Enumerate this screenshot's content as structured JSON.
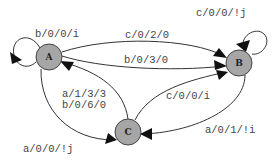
{
  "diagram": {
    "type": "state-machine",
    "nodes": [
      {
        "id": "A",
        "label": "A"
      },
      {
        "id": "B",
        "label": "B"
      },
      {
        "id": "C",
        "label": "C"
      }
    ],
    "edges": [
      {
        "from": "A",
        "to": "A",
        "label": "b/0/0/i"
      },
      {
        "from": "A",
        "to": "B",
        "label": "c/0/2/0"
      },
      {
        "from": "A",
        "to": "B",
        "label": "b/0/3/0"
      },
      {
        "from": "B",
        "to": "B",
        "label": "c/0/0/!j"
      },
      {
        "from": "C",
        "to": "A",
        "label_lines": [
          "a/1/3/3",
          "b/0/6/0"
        ]
      },
      {
        "from": "A",
        "to": "C",
        "label": "a/0/0/!j"
      },
      {
        "from": "C",
        "to": "B",
        "label": "c/0/0/i"
      },
      {
        "from": "B",
        "to": "C",
        "label": "a/0/1/!i"
      }
    ],
    "colors": {
      "node_fill": "#a6a6a6",
      "edge": "#333333",
      "text": "#444444"
    }
  }
}
